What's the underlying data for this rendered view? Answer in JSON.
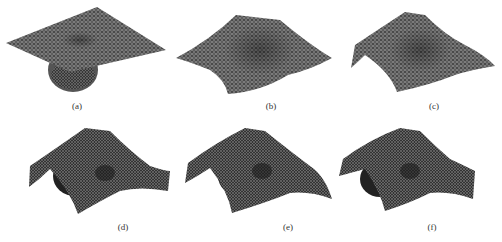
{
  "figure": {
    "panels": [
      {
        "id": "a",
        "label": "(a)"
      },
      {
        "id": "b",
        "label": "(b)"
      },
      {
        "id": "c",
        "label": "(c)"
      },
      {
        "id": "d",
        "label": "(d)"
      },
      {
        "id": "e",
        "label": "(e)"
      },
      {
        "id": "f",
        "label": "(f)"
      }
    ],
    "colors": {
      "mesh_dark": "#2a2a2a",
      "mesh_mid": "#5a5a5a",
      "mesh_light": "#8a8a8a",
      "background": "#ffffff"
    }
  }
}
